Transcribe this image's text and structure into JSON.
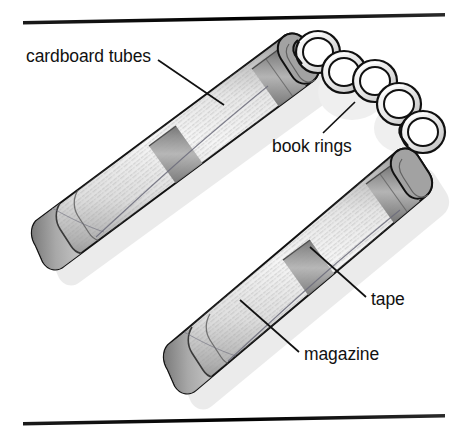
{
  "figure": {
    "background_color": "#ffffff",
    "line_color": "#111111",
    "tube_light": "#f2f2f2",
    "tube_mid": "#c9c9c9",
    "tube_dark": "#8e8e8e",
    "tape_color": "#8a8a8a",
    "shadow_color": "#d9d9d9"
  },
  "rules": {
    "top_label": "top-rule",
    "bottom_label": "bottom-rule"
  },
  "labels": [
    {
      "id": "cardboard-tubes",
      "text": "cardboard tubes",
      "x": 26,
      "y": 62,
      "anchor": "start",
      "leader": "M158,60 L224,105"
    },
    {
      "id": "book-rings",
      "text": "book rings",
      "x": 272,
      "y": 152,
      "anchor": "start",
      "leader": "M355,102 L323,133"
    },
    {
      "id": "tape",
      "text": "tape",
      "x": 371,
      "y": 305,
      "anchor": "start",
      "leader": "M310,247 L366,297"
    },
    {
      "id": "magazine",
      "text": "magazine",
      "x": 304,
      "y": 360,
      "anchor": "start",
      "leader": "M240,300 L299,352"
    }
  ],
  "parts": {
    "tube_upper": "upper-cardboard-tube",
    "tube_lower": "lower-cardboard-tube",
    "ring_count": 5,
    "ring_label": "book-ring",
    "tape_bands": [
      "upper-tube-end-tape",
      "upper-tube-mid-tape",
      "lower-tube-end-tape",
      "lower-tube-mid-tape"
    ]
  }
}
